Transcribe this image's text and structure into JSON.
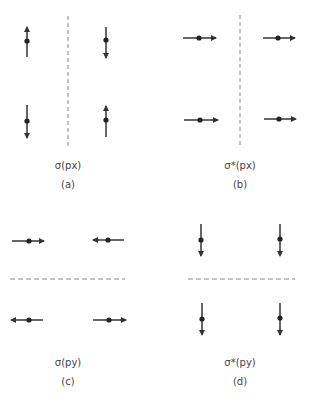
{
  "panels": [
    {
      "id": "a",
      "label": "σ(px)",
      "sublabel": "(a)",
      "node_plane": "vertical",
      "vectors": [
        {
          "position": "top-left",
          "direction": "up"
        },
        {
          "position": "top-right",
          "direction": "down"
        },
        {
          "position": "bottom-left",
          "direction": "down"
        },
        {
          "position": "bottom-right",
          "direction": "up"
        }
      ]
    },
    {
      "id": "b",
      "label": "σ*(px)",
      "sublabel": "(b)",
      "node_plane": "vertical",
      "vectors": [
        {
          "position": "top-left",
          "direction": "right"
        },
        {
          "position": "top-right",
          "direction": "right"
        },
        {
          "position": "bottom-left",
          "direction": "right"
        },
        {
          "position": "bottom-right",
          "direction": "right"
        }
      ]
    },
    {
      "id": "c",
      "label": "σ(py)",
      "sublabel": "(c)",
      "node_plane": "horizontal",
      "vectors": [
        {
          "position": "top-left",
          "direction": "right"
        },
        {
          "position": "top-right",
          "direction": "left"
        },
        {
          "position": "bottom-left",
          "direction": "left"
        },
        {
          "position": "bottom-right",
          "direction": "right"
        }
      ]
    },
    {
      "id": "d",
      "label": "σ*(py)",
      "sublabel": "(d)",
      "node_plane": "horizontal",
      "vectors": [
        {
          "position": "top-left",
          "direction": "down"
        },
        {
          "position": "top-right",
          "direction": "down"
        },
        {
          "position": "bottom-left",
          "direction": "down"
        },
        {
          "position": "bottom-right",
          "direction": "down"
        }
      ]
    }
  ],
  "colors": {
    "stroke": "#333333",
    "dash": "#888888",
    "text": "#444444"
  }
}
